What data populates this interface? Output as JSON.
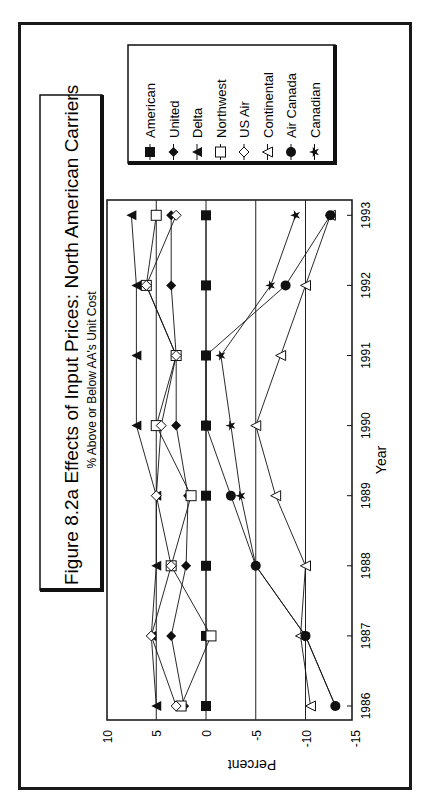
{
  "page": {
    "number": "",
    "mark": ""
  },
  "chart_data": {
    "type": "line",
    "orientation": "rotated-90-clockwise",
    "title": "Figure 8.2a  Effects of Input Prices: North American Carriers",
    "subtitle": "% Above or Below AA's Unit Cost",
    "xlabel": "Year",
    "ylabel": "Percent",
    "categories": [
      "1986",
      "1987",
      "1988",
      "1989",
      "1990",
      "1991",
      "1992",
      "1993"
    ],
    "y_ticks": [
      "10",
      "5",
      "0",
      "-5",
      "-10",
      "-15"
    ],
    "ylim": [
      -15,
      10
    ],
    "grid": {
      "horizontal_lines_at": [
        5,
        0,
        -5,
        -10
      ]
    },
    "legend_position": "right (top of rotated page)",
    "series": [
      {
        "name": "American",
        "marker": "filled-square",
        "values": [
          0,
          0,
          0,
          0,
          0,
          0,
          0,
          0
        ]
      },
      {
        "name": "United",
        "marker": "filled-diamond",
        "values": [
          2.2,
          3.5,
          2.0,
          1.8,
          3.0,
          3.0,
          3.5,
          3.5
        ]
      },
      {
        "name": "Delta",
        "marker": "filled-triangle",
        "values": [
          5.0,
          5.5,
          5.0,
          5.0,
          7.0,
          7.0,
          7.0,
          7.5
        ]
      },
      {
        "name": "Northwest",
        "marker": "open-square",
        "values": [
          2.5,
          -0.5,
          3.5,
          1.5,
          5.0,
          3.0,
          6.0,
          5.0
        ]
      },
      {
        "name": "US Air",
        "marker": "open-diamond",
        "values": [
          3.0,
          5.5,
          3.5,
          5.0,
          4.5,
          3.0,
          6.0,
          3.0
        ]
      },
      {
        "name": "Continental",
        "marker": "open-triangle",
        "values": [
          -10.5,
          -9.5,
          -10.0,
          -7.0,
          -5.0,
          -7.5,
          -10.0,
          -12.5
        ]
      },
      {
        "name": "Air Canada",
        "marker": "filled-circle",
        "values": [
          -13.0,
          -10.0,
          -5.0,
          -2.5,
          0.0,
          0.0,
          -8.0,
          -12.5
        ]
      },
      {
        "name": "Canadian",
        "marker": "star",
        "values": [
          -13.0,
          -10.0,
          -5.0,
          -3.5,
          -2.5,
          -1.5,
          -6.5,
          -9.0
        ]
      }
    ]
  }
}
